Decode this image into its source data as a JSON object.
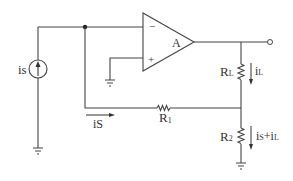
{
  "diagram": {
    "type": "circuit",
    "colors": {
      "wire": "#444444",
      "text": "#333333",
      "background": "#ffffff"
    },
    "components": {
      "current_source": {
        "label": "is"
      },
      "opamp": {
        "label": "A",
        "minus": "−",
        "plus": "+"
      },
      "load_resistor": {
        "label_main": "R",
        "label_sub": "L"
      },
      "r1": {
        "label_main": "R",
        "label_sub": "1"
      },
      "r2": {
        "label_main": "R",
        "label_sub": "2"
      }
    },
    "currents": {
      "is_wire": {
        "label_main": "i",
        "label_sub": "S"
      },
      "iL": {
        "label_main": "i",
        "label_sub": "L"
      },
      "sum": {
        "label_main": "i",
        "label_sub1": "S",
        "plus": "+i",
        "label_sub2": "L"
      }
    }
  }
}
